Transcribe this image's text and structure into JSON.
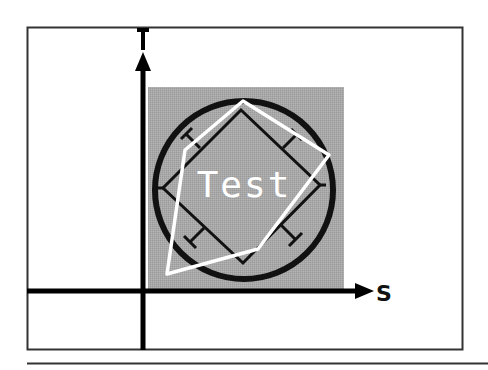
{
  "diagram": {
    "type": "texture-space-mapping",
    "axes": {
      "horizontal": {
        "label": "S"
      },
      "vertical": {
        "label": "T"
      }
    },
    "texture": {
      "text": "Test",
      "background_color": "#a6a6a6",
      "shapes": [
        "circle-outline",
        "rotated-square-with-tick-marks"
      ]
    },
    "overlay_polygon": {
      "color": "#ffffff",
      "description": "white quadrilateral mapped onto texture"
    },
    "colors": {
      "frame": "#333333",
      "axis": "#000000",
      "texture_bg": "#a6a6a6",
      "shape_stroke": "#111111",
      "overlay": "#ffffff"
    }
  }
}
